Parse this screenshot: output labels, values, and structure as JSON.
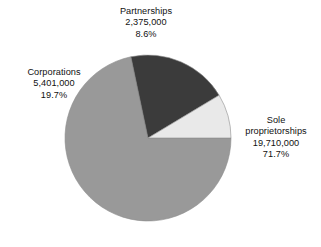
{
  "chart_data": {
    "type": "pie",
    "title": "",
    "subtitle": "",
    "xlabel": "",
    "ylabel": "",
    "legend_position": "none",
    "grid": false,
    "categories": [
      "Sole proprietorships",
      "Corporations",
      "Partnerships"
    ],
    "values": [
      19710000,
      5401000,
      2375000
    ],
    "percentages": [
      71.7,
      19.7,
      8.6
    ],
    "colors": [
      "#999999",
      "#3b3b3b",
      "#e9e9e9"
    ],
    "slices": [
      {
        "name": "Sole proprietorships",
        "value": 19710000,
        "value_label": "19,710,000",
        "percent": 71.7,
        "percent_label": "71.7%",
        "color": "#999999",
        "start_angle_deg": 0,
        "end_angle_deg": 258.1
      },
      {
        "name": "Corporations",
        "value": 5401000,
        "value_label": "5,401,000",
        "percent": 19.7,
        "percent_label": "19.7%",
        "color": "#3b3b3b",
        "start_angle_deg": 258.1,
        "end_angle_deg": 329.0
      },
      {
        "name": "Partnerships",
        "value": 2375000,
        "value_label": "2,375,000",
        "percent": 8.6,
        "percent_label": "8.6%",
        "color": "#e9e9e9",
        "start_angle_deg": 329.0,
        "end_angle_deg": 360
      }
    ]
  },
  "labels": {
    "partnerships": {
      "name": "Partnerships",
      "value": "2,375,000",
      "percent": "8.6%"
    },
    "corporations": {
      "name": "Corporations",
      "value": "5,401,000",
      "percent": "19.7%"
    },
    "sole_proprietorships": {
      "name": "Sole",
      "name2": "proprietorships",
      "value": "19,710,000",
      "percent": "71.7%"
    }
  },
  "geometry": {
    "center_x": 148,
    "center_y": 138,
    "radius": 83
  },
  "colors": {
    "background": "#ffffff",
    "text": "#111111",
    "slice_sole": "#999999",
    "slice_corporations": "#3b3b3b",
    "slice_partnerships": "#e9e9e9",
    "slice_outline": "#8d8d8d"
  }
}
